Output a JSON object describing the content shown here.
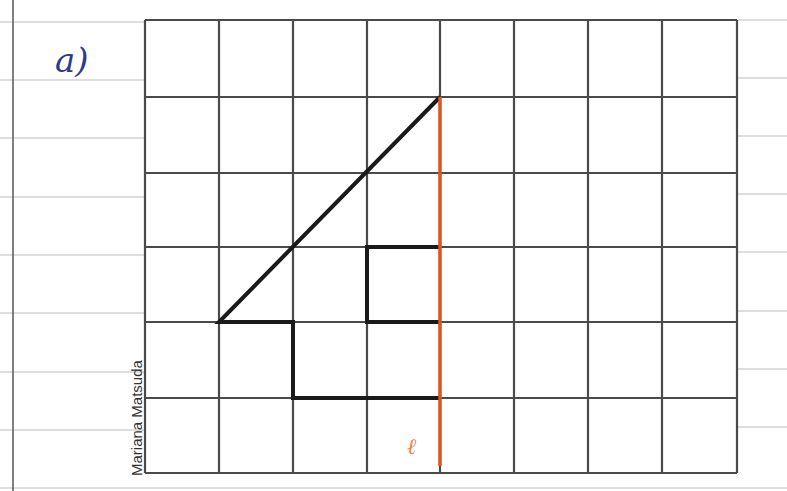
{
  "item_label": "a)",
  "axis_label": "ℓ",
  "credit": "Mariana Matsuda",
  "colors": {
    "grid": "#4a4a4a",
    "figure": "#1a1a1a",
    "axis_of_symmetry": "#e0551e",
    "notebook_lines": "#b8b8b8",
    "item_label": "#2e3a8a"
  },
  "grid": {
    "columns": 8,
    "rows": 6,
    "x_lines": [
      145,
      219,
      293,
      367,
      440,
      514,
      588,
      662,
      737
    ],
    "y_lines": [
      20,
      97,
      173,
      247,
      322,
      398,
      473
    ]
  },
  "figure": {
    "polyline_points_grid": [
      [
        4,
        1
      ],
      [
        1,
        4
      ],
      [
        2,
        4
      ],
      [
        2,
        5
      ],
      [
        4,
        5
      ]
    ],
    "inner_square_points_grid": [
      [
        4,
        3
      ],
      [
        3,
        3
      ],
      [
        3,
        4
      ],
      [
        4,
        4
      ]
    ]
  },
  "symmetry_axis": {
    "grid_x": 4,
    "from_grid_y": 1,
    "to_grid_y": 6
  }
}
